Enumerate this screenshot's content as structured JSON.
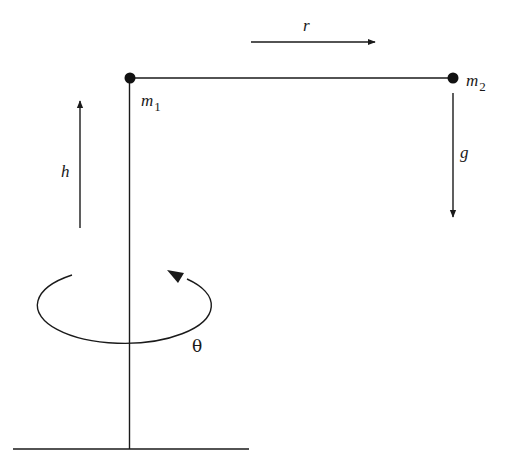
{
  "diagram": {
    "labels": {
      "radius": "r",
      "mass1_symbol": "m",
      "mass1_subscript": "1",
      "mass2_symbol": "m",
      "mass2_subscript": "2",
      "gravity": "g",
      "height": "h",
      "rotation_angle": "θ"
    },
    "colors": {
      "stroke": "#1a1a1a",
      "background": "#ffffff"
    }
  }
}
